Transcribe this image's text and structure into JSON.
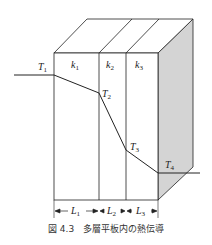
{
  "figure": {
    "caption": "図 4.3　多層平板内の熱伝導",
    "layers": [
      {
        "conductivity": "k",
        "conductivity_sub": "1",
        "thickness": "L",
        "thickness_sub": "1"
      },
      {
        "conductivity": "k",
        "conductivity_sub": "2",
        "thickness": "L",
        "thickness_sub": "2"
      },
      {
        "conductivity": "k",
        "conductivity_sub": "3",
        "thickness": "L",
        "thickness_sub": "3"
      }
    ],
    "temperatures": [
      {
        "symbol": "T",
        "sub": "1"
      },
      {
        "symbol": "T",
        "sub": "2"
      },
      {
        "symbol": "T",
        "sub": "3"
      },
      {
        "symbol": "T",
        "sub": "4"
      }
    ],
    "colors": {
      "line": "#222222",
      "shaded_face": "#d4d4d4"
    }
  }
}
